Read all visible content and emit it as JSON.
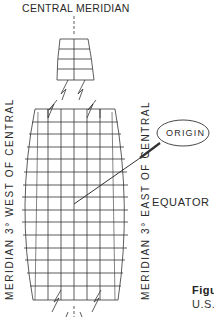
{
  "diagram": {
    "type": "transverse-mercator-zone-schematic",
    "labels": {
      "central_meridian": "CENTRAL MERIDIAN",
      "west_meridian": "MERIDIAN 3° WEST OF CENTRAL",
      "east_meridian": "MERIDIAN 3° EAST OF CENTRAL",
      "origin": "ORIGIN",
      "equator": "EQUATOR"
    },
    "caption": {
      "line1": "Figu",
      "line2": "U.S."
    },
    "grid": {
      "top_tile": {
        "columns": 2,
        "rows": 4
      },
      "main_zone": {
        "columns": 8,
        "rows": 15
      }
    },
    "colors": {
      "line": "#333333",
      "background": "#ffffff",
      "text": "#2a2a2a"
    }
  }
}
